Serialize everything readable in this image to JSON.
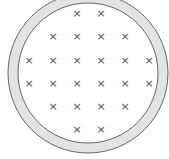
{
  "diagram": {
    "outer_ring": {
      "cx": 88,
      "cy": 73,
      "r_outer": 80,
      "r_inner": 70,
      "fill": "#e3e3e3",
      "stroke": "#666666"
    },
    "mark_symbol": "×",
    "mark_color": "#555555",
    "rows": [
      {
        "y": 13,
        "xs": [
          77,
          101
        ]
      },
      {
        "y": 36,
        "xs": [
          53,
          77,
          101,
          125
        ]
      },
      {
        "y": 60,
        "xs": [
          29,
          53,
          77,
          101,
          125,
          149
        ]
      },
      {
        "y": 83,
        "xs": [
          29,
          53,
          77,
          101,
          125,
          149
        ]
      },
      {
        "y": 106,
        "xs": [
          53,
          77,
          101,
          125
        ]
      },
      {
        "y": 129,
        "xs": [
          77,
          101
        ]
      }
    ]
  }
}
